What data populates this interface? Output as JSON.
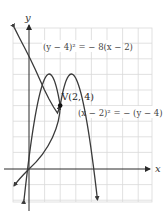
{
  "figure": {
    "type": "diagram",
    "axes": {
      "x_label": "x",
      "y_label": "y",
      "origin_px": [
        29,
        169
      ],
      "unit_px": 15.6,
      "grid": {
        "on": true,
        "x_range": [
          -1,
          8
        ],
        "y_range": [
          -2,
          9
        ]
      }
    },
    "curves": [
      {
        "name": "left-opening-parabola",
        "equation": "(y − 4)² = − 8(x − 2)",
        "label_text": "(y − 4)² = − 8(x − 2)",
        "opens": "left",
        "vertex": [
          2,
          4
        ]
      },
      {
        "name": "downward-opening-parabola",
        "equation": "(x − 2)² = − (y − 4)",
        "label_text": "(x − 2)² = − (y − 4)",
        "opens": "down",
        "vertex": [
          2,
          4
        ]
      }
    ],
    "vertex": {
      "label": "V(2, 4)",
      "x": 2,
      "y": 4
    },
    "colors": {
      "grid": "#d6d6d6",
      "curve": "#3a3a3a",
      "axis": "#2a2a2a",
      "label": "#444444"
    }
  }
}
